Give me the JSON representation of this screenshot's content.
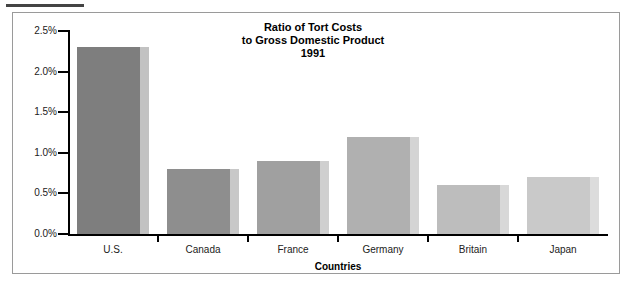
{
  "chart_data": {
    "type": "bar",
    "title": "Ratio of Tort Costs\nto Gross Domestic Product\n1991",
    "title_lines": [
      "Ratio of Tort Costs",
      "to Gross Domestic Product",
      "1991"
    ],
    "categories": [
      "U.S.",
      "Canada",
      "France",
      "Germany",
      "Britain",
      "Japan"
    ],
    "values": [
      2.3,
      0.8,
      0.9,
      1.2,
      0.6,
      0.7
    ],
    "value_labels": [
      "2.3%",
      "0.8%",
      "0.9%",
      "1.2%",
      "0.6%",
      "0.7%"
    ],
    "xlabel": "Countries",
    "ylabel": "",
    "ylim": [
      0.0,
      2.5
    ],
    "ytick_values": [
      0.0,
      0.5,
      1.0,
      1.5,
      2.0,
      2.5
    ],
    "ytick_labels": [
      "0.0%",
      "0.5%",
      "1.0%",
      "1.5%",
      "2.0%",
      "2.5%"
    ],
    "grid": false,
    "legend": null,
    "bar_colors": [
      "#7e7e7e",
      "#8e8e8e",
      "#a0a0a0",
      "#b0b0b0",
      "#bdbdbd",
      "#c9c9c9"
    ],
    "bar_side_colors": [
      "#c2c2c2",
      "#c8c8c8",
      "#cfcfcf",
      "#d4d4d4",
      "#d8d8d8",
      "#dcdcdc"
    ],
    "axis_color": "#000000",
    "frame_color": "#9a9a9a",
    "background": "#ffffff"
  }
}
